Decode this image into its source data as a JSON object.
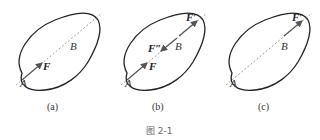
{
  "figure": {
    "caption": "图 2-1",
    "panels": [
      {
        "id": "a",
        "label": "(a)",
        "points": {
          "A": "A",
          "B": "B"
        },
        "forces": [
          {
            "label": "F",
            "at": "A",
            "direction": "up-right"
          }
        ]
      },
      {
        "id": "b",
        "label": "(b)",
        "points": {
          "A": "A",
          "B": "B"
        },
        "forces": [
          {
            "label": "F",
            "at": "A",
            "direction": "up-right"
          },
          {
            "label": "F″",
            "at": "B",
            "direction": "down-left"
          },
          {
            "label": "F′",
            "at": "B",
            "direction": "up-right"
          }
        ]
      },
      {
        "id": "c",
        "label": "(c)",
        "points": {
          "A": "A",
          "B": "B"
        },
        "forces": [
          {
            "label": "F′",
            "at": "B",
            "direction": "up-right"
          }
        ]
      }
    ]
  },
  "colors": {
    "outline": "#222222",
    "line_of_action": "#888888",
    "force": "#555555"
  }
}
